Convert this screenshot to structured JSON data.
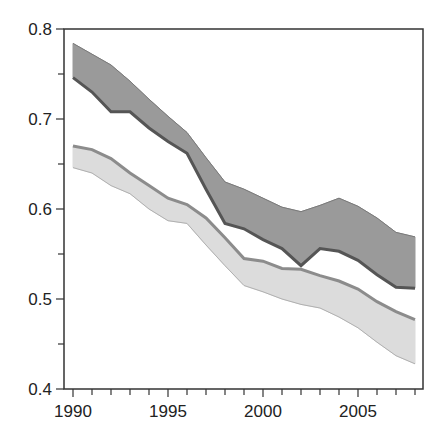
{
  "chart_data": {
    "type": "area",
    "title": "",
    "xlabel": "",
    "ylabel": "",
    "xlim": [
      1989.5,
      2008.5
    ],
    "ylim": [
      0.4,
      0.8
    ],
    "x": [
      1990,
      1991,
      1992,
      1993,
      1994,
      1995,
      1996,
      1997,
      1998,
      1999,
      2000,
      2001,
      2002,
      2003,
      2004,
      2005,
      2006,
      2007,
      2008
    ],
    "x_ticks": [
      1990,
      1995,
      2000,
      2005
    ],
    "x_tick_labels": [
      "1990",
      "1995",
      "2000",
      "2005"
    ],
    "y_ticks": [
      0.4,
      0.5,
      0.6,
      0.7,
      0.8
    ],
    "y_tick_labels": [
      "0.4",
      "0.5",
      "0.6",
      "0.7",
      "0.8"
    ],
    "grid": false,
    "legend": null,
    "series": [
      {
        "name": "upper band",
        "fill": "#9a9a9a",
        "edge": "#606060",
        "upper": [
          0.784,
          0.772,
          0.76,
          0.742,
          0.722,
          0.703,
          0.685,
          0.657,
          0.63,
          0.622,
          0.612,
          0.602,
          0.597,
          0.604,
          0.612,
          0.603,
          0.59,
          0.574,
          0.569
        ],
        "lower": [
          0.746,
          0.73,
          0.708,
          0.708,
          0.69,
          0.675,
          0.662,
          0.622,
          0.584,
          0.578,
          0.566,
          0.556,
          0.537,
          0.556,
          0.553,
          0.543,
          0.527,
          0.513,
          0.512
        ]
      },
      {
        "name": "lower band",
        "fill": "#dcdcdc",
        "edge": "#9a9a9a",
        "upper": [
          0.67,
          0.666,
          0.656,
          0.64,
          0.626,
          0.612,
          0.605,
          0.59,
          0.568,
          0.545,
          0.542,
          0.534,
          0.533,
          0.526,
          0.52,
          0.511,
          0.497,
          0.486,
          0.477
        ],
        "lower": [
          0.646,
          0.64,
          0.626,
          0.617,
          0.6,
          0.587,
          0.584,
          0.56,
          0.537,
          0.515,
          0.508,
          0.5,
          0.494,
          0.49,
          0.48,
          0.468,
          0.452,
          0.437,
          0.428
        ]
      }
    ]
  }
}
